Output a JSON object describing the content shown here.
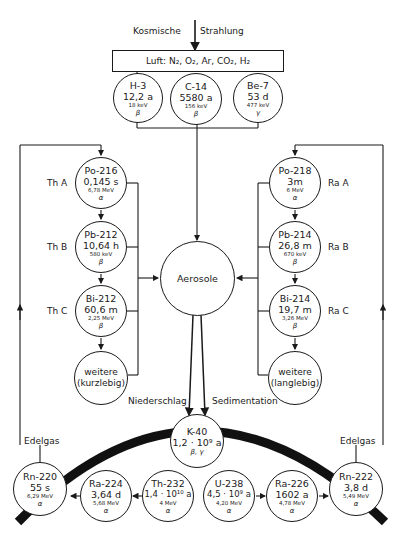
{
  "header": {
    "source_label_left": "Kosmische",
    "source_label_right": "Strahlung",
    "air_box": "Luft: N₂, O₂, Ar, CO₂, H₂"
  },
  "cosmogenic": [
    {
      "name": "H-3",
      "half_life": "12,2 a",
      "energy": "18 keV",
      "decay": "β"
    },
    {
      "name": "C-14",
      "half_life": "5580 a",
      "energy": "156 keV",
      "decay": "β"
    },
    {
      "name": "Be-7",
      "half_life": "53 d",
      "energy": "477 keV",
      "decay": "γ"
    }
  ],
  "thorium_chain": [
    {
      "label": "Th A",
      "name": "Po-216",
      "half_life": "0,145 s",
      "energy": "6,78 MeV",
      "decay": "α"
    },
    {
      "label": "Th B",
      "name": "Pb-212",
      "half_life": "10,64 h",
      "energy": "580 keV",
      "decay": "β"
    },
    {
      "label": "Th C",
      "name": "Bi-212",
      "half_life": "60,6 m",
      "energy": "2,25 MeV",
      "decay": "β"
    },
    {
      "line1": "weitere",
      "line2": "(kurzlebig)"
    }
  ],
  "radium_chain": [
    {
      "label": "Ra A",
      "name": "Po-218",
      "half_life": "3m",
      "energy": "6 MeV",
      "decay": "α"
    },
    {
      "label": "Ra B",
      "name": "Pb-214",
      "half_life": "26,8 m",
      "energy": "670 keV",
      "decay": "β"
    },
    {
      "label": "Ra C",
      "name": "Bi-214",
      "half_life": "19,7 m",
      "energy": "3,26 MeV",
      "decay": "β"
    },
    {
      "line1": "weitere",
      "line2": "(langlebig)"
    }
  ],
  "center": {
    "label": "Aerosole"
  },
  "flows": {
    "left": "Niederschlag",
    "right": "Sedimentation",
    "noble_gas_left": "Edelgas",
    "noble_gas_right": "Edelgas"
  },
  "ground": {
    "k40": {
      "name": "K-40",
      "half_life": "1,2 · 10⁹ a",
      "decay": "β, γ"
    },
    "thorium_series": [
      {
        "name": "Rn-220",
        "half_life": "55 s",
        "energy": "6,29 MeV",
        "decay": "α"
      },
      {
        "name": "Ra-224",
        "half_life": "3,64 d",
        "energy": "5,68 MeV",
        "decay": "α"
      },
      {
        "name": "Th-232",
        "half_life": "1,4 · 10¹⁰ a",
        "energy": "4 MeV",
        "decay": "α"
      }
    ],
    "uranium_series": [
      {
        "name": "U-238",
        "half_life": "4,5 · 10⁹ a",
        "energy": "4,20 MeV",
        "decay": "α"
      },
      {
        "name": "Ra-226",
        "half_life": "1602 a",
        "energy": "4,78 MeV",
        "decay": "α"
      },
      {
        "name": "Rn-222",
        "half_life": "3,8 d",
        "energy": "5,49 MeV",
        "decay": "α"
      }
    ]
  },
  "colors": {
    "ink": "#1a1a1a",
    "background": "#ffffff"
  }
}
